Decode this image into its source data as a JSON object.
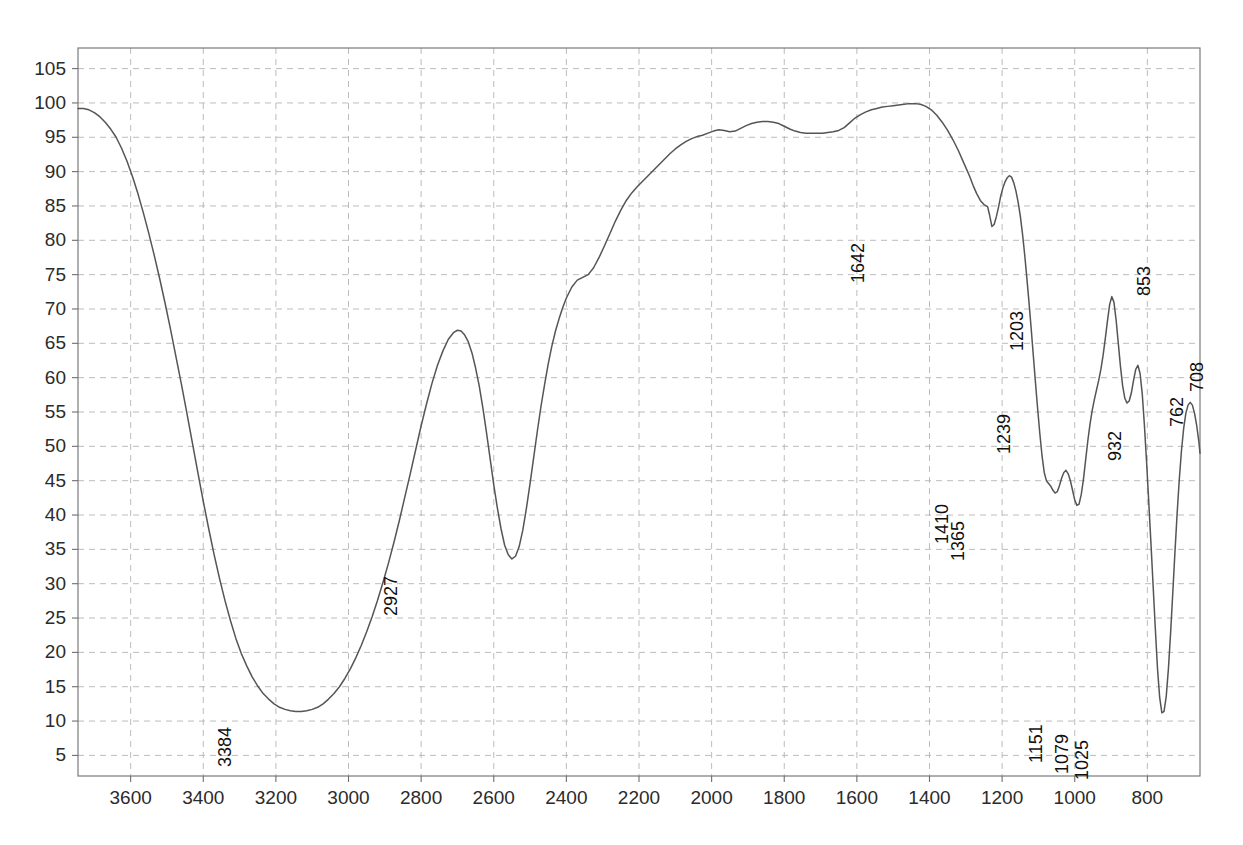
{
  "chart_data": {
    "type": "line",
    "title": "",
    "subtitle": "",
    "xlabel": "",
    "ylabel": "",
    "xlim": [
      3745,
      655
    ],
    "ylim": [
      2,
      108
    ],
    "x_axis_direction": "descending",
    "grid": true,
    "legend": null,
    "axis_color": "#6e6e6e",
    "grid_color": "#b4b4b4",
    "curve_color": "#555555",
    "background": "#ffffff",
    "x_ticks": [
      3600,
      3400,
      3200,
      3000,
      2800,
      2600,
      2400,
      2200,
      2000,
      1800,
      1600,
      1400,
      1200,
      1000,
      800
    ],
    "y_ticks": [
      5,
      10,
      15,
      20,
      25,
      30,
      35,
      40,
      45,
      50,
      55,
      60,
      65,
      70,
      75,
      80,
      85,
      90,
      95,
      100,
      105
    ],
    "annotations": [
      {
        "label": "3384",
        "x": 3384,
        "y": 11.5
      },
      {
        "label": "2927",
        "x": 2927,
        "y": 33.5
      },
      {
        "label": "1642",
        "x": 1642,
        "y": 82.0
      },
      {
        "label": "1410",
        "x": 1410,
        "y": 44.0
      },
      {
        "label": "1365",
        "x": 1365,
        "y": 41.5
      },
      {
        "label": "1239",
        "x": 1239,
        "y": 57.0
      },
      {
        "label": "1203",
        "x": 1203,
        "y": 72.0
      },
      {
        "label": "1151",
        "x": 1151,
        "y": 12.0
      },
      {
        "label": "1079",
        "x": 1079,
        "y": 10.5
      },
      {
        "label": "1025",
        "x": 1025,
        "y": 9.5
      },
      {
        "label": "932",
        "x": 932,
        "y": 56.0
      },
      {
        "label": "853",
        "x": 853,
        "y": 80.0
      },
      {
        "label": "762",
        "x": 762,
        "y": 61.0
      },
      {
        "label": "708",
        "x": 708,
        "y": 66.0
      }
    ],
    "series": [
      {
        "name": "transmittance",
        "points": [
          [
            3745,
            99.2
          ],
          [
            3730,
            99.2
          ],
          [
            3715,
            99.0
          ],
          [
            3700,
            98.6
          ],
          [
            3685,
            98.0
          ],
          [
            3670,
            97.2
          ],
          [
            3655,
            96.2
          ],
          [
            3640,
            95.0
          ],
          [
            3625,
            93.4
          ],
          [
            3610,
            91.5
          ],
          [
            3595,
            89.3
          ],
          [
            3580,
            86.8
          ],
          [
            3565,
            84.0
          ],
          [
            3550,
            81.0
          ],
          [
            3535,
            77.8
          ],
          [
            3520,
            74.4
          ],
          [
            3505,
            70.8
          ],
          [
            3490,
            67.0
          ],
          [
            3475,
            63.0
          ],
          [
            3460,
            59.0
          ],
          [
            3445,
            54.8
          ],
          [
            3430,
            50.5
          ],
          [
            3415,
            46.2
          ],
          [
            3400,
            42.0
          ],
          [
            3385,
            38.0
          ],
          [
            3370,
            34.2
          ],
          [
            3355,
            30.7
          ],
          [
            3340,
            27.5
          ],
          [
            3325,
            24.6
          ],
          [
            3310,
            22.0
          ],
          [
            3295,
            19.8
          ],
          [
            3280,
            18.0
          ],
          [
            3265,
            16.4
          ],
          [
            3250,
            15.1
          ],
          [
            3235,
            14.0
          ],
          [
            3220,
            13.2
          ],
          [
            3205,
            12.5
          ],
          [
            3190,
            12.0
          ],
          [
            3175,
            11.7
          ],
          [
            3160,
            11.5
          ],
          [
            3145,
            11.4
          ],
          [
            3130,
            11.4
          ],
          [
            3115,
            11.5
          ],
          [
            3100,
            11.7
          ],
          [
            3085,
            12.0
          ],
          [
            3070,
            12.5
          ],
          [
            3055,
            13.2
          ],
          [
            3040,
            14.0
          ],
          [
            3025,
            15.0
          ],
          [
            3010,
            16.2
          ],
          [
            2995,
            17.6
          ],
          [
            2980,
            19.2
          ],
          [
            2965,
            21.0
          ],
          [
            2950,
            23.0
          ],
          [
            2935,
            25.2
          ],
          [
            2920,
            27.6
          ],
          [
            2905,
            30.2
          ],
          [
            2890,
            33.0
          ],
          [
            2875,
            36.0
          ],
          [
            2860,
            39.2
          ],
          [
            2845,
            42.6
          ],
          [
            2830,
            46.0
          ],
          [
            2815,
            49.5
          ],
          [
            2800,
            53.0
          ],
          [
            2785,
            56.2
          ],
          [
            2770,
            59.2
          ],
          [
            2755,
            61.8
          ],
          [
            2740,
            63.9
          ],
          [
            2725,
            65.6
          ],
          [
            2710,
            66.6
          ],
          [
            2700,
            66.9
          ],
          [
            2690,
            66.8
          ],
          [
            2680,
            66.2
          ],
          [
            2670,
            65.2
          ],
          [
            2660,
            63.6
          ],
          [
            2650,
            61.4
          ],
          [
            2640,
            58.8
          ],
          [
            2630,
            55.6
          ],
          [
            2620,
            52.0
          ],
          [
            2610,
            48.2
          ],
          [
            2600,
            44.4
          ],
          [
            2590,
            41.0
          ],
          [
            2580,
            38.0
          ],
          [
            2570,
            35.6
          ],
          [
            2560,
            34.2
          ],
          [
            2550,
            33.6
          ],
          [
            2540,
            34.0
          ],
          [
            2530,
            35.4
          ],
          [
            2520,
            37.8
          ],
          [
            2510,
            41.0
          ],
          [
            2500,
            44.6
          ],
          [
            2490,
            48.4
          ],
          [
            2480,
            52.2
          ],
          [
            2470,
            55.8
          ],
          [
            2460,
            59.0
          ],
          [
            2450,
            62.0
          ],
          [
            2440,
            64.6
          ],
          [
            2430,
            66.8
          ],
          [
            2420,
            68.6
          ],
          [
            2410,
            70.2
          ],
          [
            2400,
            71.6
          ],
          [
            2385,
            73.2
          ],
          [
            2370,
            74.2
          ],
          [
            2355,
            74.6
          ],
          [
            2340,
            75.0
          ],
          [
            2325,
            76.0
          ],
          [
            2310,
            77.5
          ],
          [
            2295,
            79.2
          ],
          [
            2280,
            81.0
          ],
          [
            2265,
            82.8
          ],
          [
            2250,
            84.4
          ],
          [
            2235,
            85.8
          ],
          [
            2220,
            86.9
          ],
          [
            2205,
            87.8
          ],
          [
            2190,
            88.6
          ],
          [
            2175,
            89.4
          ],
          [
            2160,
            90.2
          ],
          [
            2145,
            91.0
          ],
          [
            2130,
            91.8
          ],
          [
            2115,
            92.6
          ],
          [
            2100,
            93.3
          ],
          [
            2085,
            93.9
          ],
          [
            2070,
            94.4
          ],
          [
            2055,
            94.8
          ],
          [
            2040,
            95.1
          ],
          [
            2025,
            95.3
          ],
          [
            2010,
            95.6
          ],
          [
            1995,
            95.9
          ],
          [
            1980,
            96.1
          ],
          [
            1965,
            96.0
          ],
          [
            1950,
            95.8
          ],
          [
            1935,
            95.9
          ],
          [
            1920,
            96.3
          ],
          [
            1905,
            96.7
          ],
          [
            1890,
            97.0
          ],
          [
            1875,
            97.2
          ],
          [
            1860,
            97.3
          ],
          [
            1845,
            97.3
          ],
          [
            1830,
            97.2
          ],
          [
            1815,
            97.0
          ],
          [
            1800,
            96.6
          ],
          [
            1785,
            96.2
          ],
          [
            1770,
            95.9
          ],
          [
            1755,
            95.7
          ],
          [
            1740,
            95.6
          ],
          [
            1725,
            95.6
          ],
          [
            1710,
            95.6
          ],
          [
            1695,
            95.6
          ],
          [
            1680,
            95.7
          ],
          [
            1665,
            95.8
          ],
          [
            1650,
            96.0
          ],
          [
            1635,
            96.4
          ],
          [
            1620,
            97.1
          ],
          [
            1605,
            97.8
          ],
          [
            1590,
            98.3
          ],
          [
            1575,
            98.7
          ],
          [
            1560,
            99.0
          ],
          [
            1545,
            99.2
          ],
          [
            1530,
            99.4
          ],
          [
            1515,
            99.5
          ],
          [
            1500,
            99.6
          ],
          [
            1485,
            99.7
          ],
          [
            1470,
            99.8
          ],
          [
            1455,
            99.9
          ],
          [
            1440,
            99.9
          ],
          [
            1425,
            99.8
          ],
          [
            1410,
            99.5
          ],
          [
            1395,
            99.0
          ],
          [
            1380,
            98.2
          ],
          [
            1365,
            97.2
          ],
          [
            1350,
            96.0
          ],
          [
            1335,
            94.6
          ],
          [
            1320,
            93.0
          ],
          [
            1305,
            91.2
          ],
          [
            1290,
            89.4
          ],
          [
            1280,
            88.0
          ],
          [
            1270,
            86.8
          ],
          [
            1260,
            85.8
          ],
          [
            1250,
            85.2
          ],
          [
            1240,
            84.9
          ],
          [
            1235,
            83.8
          ],
          [
            1228,
            82.0
          ],
          [
            1222,
            82.3
          ],
          [
            1216,
            83.4
          ],
          [
            1210,
            84.8
          ],
          [
            1204,
            86.4
          ],
          [
            1198,
            87.6
          ],
          [
            1192,
            88.5
          ],
          [
            1186,
            89.1
          ],
          [
            1180,
            89.4
          ],
          [
            1174,
            89.2
          ],
          [
            1168,
            88.4
          ],
          [
            1162,
            87.2
          ],
          [
            1156,
            85.6
          ],
          [
            1150,
            83.6
          ],
          [
            1144,
            81.0
          ],
          [
            1138,
            78.0
          ],
          [
            1132,
            74.6
          ],
          [
            1126,
            71.0
          ],
          [
            1120,
            67.2
          ],
          [
            1114,
            63.2
          ],
          [
            1108,
            59.2
          ],
          [
            1102,
            55.4
          ],
          [
            1096,
            51.8
          ],
          [
            1090,
            48.6
          ],
          [
            1084,
            46.2
          ],
          [
            1078,
            45.0
          ],
          [
            1072,
            44.6
          ],
          [
            1066,
            44.2
          ],
          [
            1060,
            43.6
          ],
          [
            1054,
            43.2
          ],
          [
            1048,
            43.4
          ],
          [
            1042,
            44.3
          ],
          [
            1036,
            45.4
          ],
          [
            1030,
            46.2
          ],
          [
            1024,
            46.5
          ],
          [
            1018,
            46.0
          ],
          [
            1012,
            45.0
          ],
          [
            1006,
            43.6
          ],
          [
            1000,
            42.2
          ],
          [
            994,
            41.4
          ],
          [
            988,
            41.6
          ],
          [
            982,
            43.0
          ],
          [
            976,
            45.2
          ],
          [
            970,
            48.0
          ],
          [
            964,
            50.8
          ],
          [
            958,
            53.2
          ],
          [
            952,
            55.2
          ],
          [
            946,
            56.8
          ],
          [
            940,
            58.2
          ],
          [
            934,
            59.6
          ],
          [
            928,
            61.2
          ],
          [
            922,
            63.2
          ],
          [
            916,
            65.6
          ],
          [
            910,
            68.2
          ],
          [
            904,
            70.6
          ],
          [
            898,
            71.8
          ],
          [
            892,
            71.0
          ],
          [
            886,
            68.4
          ],
          [
            880,
            65.0
          ],
          [
            874,
            61.6
          ],
          [
            868,
            58.8
          ],
          [
            862,
            57.0
          ],
          [
            856,
            56.3
          ],
          [
            850,
            56.6
          ],
          [
            844,
            57.8
          ],
          [
            838,
            59.6
          ],
          [
            832,
            61.2
          ],
          [
            826,
            61.8
          ],
          [
            820,
            60.6
          ],
          [
            814,
            57.6
          ],
          [
            808,
            53.0
          ],
          [
            802,
            47.6
          ],
          [
            796,
            41.8
          ],
          [
            790,
            35.8
          ],
          [
            784,
            29.6
          ],
          [
            778,
            23.4
          ],
          [
            772,
            17.6
          ],
          [
            766,
            13.4
          ],
          [
            760,
            11.2
          ],
          [
            754,
            11.4
          ],
          [
            748,
            13.6
          ],
          [
            742,
            17.6
          ],
          [
            736,
            22.8
          ],
          [
            730,
            28.6
          ],
          [
            724,
            34.6
          ],
          [
            718,
            40.2
          ],
          [
            712,
            45.2
          ],
          [
            706,
            49.4
          ],
          [
            700,
            52.6
          ],
          [
            694,
            54.8
          ],
          [
            688,
            56.0
          ],
          [
            682,
            56.4
          ],
          [
            676,
            56.0
          ],
          [
            670,
            54.8
          ],
          [
            664,
            53.0
          ],
          [
            658,
            50.6
          ],
          [
            655,
            49.0
          ]
        ]
      }
    ]
  },
  "plot_geometry": {
    "left": 78,
    "right": 1200,
    "top": 48,
    "bottom": 776
  }
}
